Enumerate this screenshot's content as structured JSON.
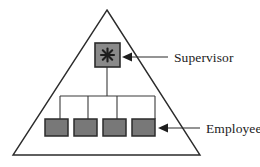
{
  "diagram": {
    "type": "organizational-hierarchy-triangle",
    "title": "",
    "shape": {
      "name": "triangle",
      "apex": [
        107,
        10
      ],
      "bottom_left": [
        13,
        155
      ],
      "bottom_right": [
        200,
        155
      ],
      "stroke": "#2b2b2b",
      "fill": "none",
      "stroke_width": 1.4
    },
    "nodes": {
      "supervisor": {
        "label": "Supervisor",
        "icon": "asterisk-starburst-icon",
        "x": 95,
        "y": 43,
        "width": 25,
        "height": 24,
        "fill": "#8a8a8a",
        "stroke": "#2b2b2b"
      },
      "employees": {
        "label": "Employees",
        "count": 4,
        "width": 23,
        "height": 17,
        "y": 119,
        "xs": [
          45,
          74,
          103,
          132
        ],
        "fill": "#787878",
        "stroke": "#2b2b2b"
      }
    },
    "connectors": {
      "stem_x": 107,
      "stem_top": 67,
      "bus_y": 96,
      "bus_left": 60,
      "bus_right": 155,
      "drop_bottom": 119,
      "stroke": "#3a3a3a",
      "stroke_width": 1.1
    },
    "annotations": [
      {
        "name": "supervisor-callout",
        "label": "Supervisor",
        "text_x": 168,
        "text_y": 62,
        "arrow_from": [
          168,
          57
        ],
        "arrow_to": [
          124,
          57
        ],
        "arrow_head": "left"
      },
      {
        "name": "employees-callout",
        "label": "Employees",
        "text_x": 202,
        "text_y": 133,
        "arrow_from": [
          200,
          128
        ],
        "arrow_to": [
          160,
          128
        ],
        "arrow_head": "left"
      }
    ],
    "colors": {
      "line": "#2b2b2b",
      "node_fill": "#787878",
      "supervisor_fill": "#8a8a8a",
      "text": "#222222",
      "background": "#ffffff"
    }
  }
}
